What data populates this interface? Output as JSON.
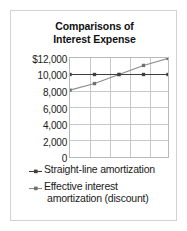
{
  "chart_data": {
    "type": "line",
    "title": "Comparisons of Interest Expense",
    "title_line1": "Comparisons of",
    "title_line2": "Interest Expense",
    "xlabel": "",
    "ylabel": "",
    "ylim": [
      0,
      12000
    ],
    "yticks": [
      12000,
      10000,
      8000,
      6000,
      4000,
      2000,
      0
    ],
    "ytick_labels": [
      "$12,000",
      "10,000",
      "8,000",
      "6,000",
      "4,000",
      "2,000",
      "0"
    ],
    "x": [
      1,
      2,
      3,
      4,
      5
    ],
    "xtick_labels": [
      "",
      "",
      "",
      "",
      ""
    ],
    "grid": true,
    "legend_position": "bottom",
    "series": [
      {
        "name": "Straight-line amortization",
        "name_line1": "Straight-line amortization",
        "name_line2": "",
        "values": [
          10000,
          10000,
          10000,
          10000,
          10000
        ],
        "color": "#3f3f3f",
        "marker": "square"
      },
      {
        "name": "Effective interest amortization (discount)",
        "name_line1": "Effective interest",
        "name_line2": "amortization (discount)",
        "values": [
          8100,
          8900,
          10000,
          11100,
          11950
        ],
        "color": "#8a8a8a",
        "marker": "square"
      }
    ]
  },
  "style": {
    "frame_color": "#d2d2d2",
    "grid_color": "#c8c8c8",
    "axis_color": "#b9b9b9",
    "text_color": "#1a1a1a",
    "background": "#ffffff"
  }
}
